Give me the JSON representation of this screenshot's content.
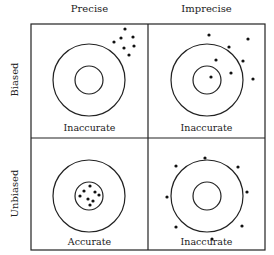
{
  "columns": [
    {
      "label": "Precise"
    },
    {
      "label": "Imprecise"
    }
  ],
  "rows": [
    {
      "label": "Biased"
    },
    {
      "label": "Unbiased"
    }
  ],
  "cells": [
    {
      "id": "biased-precise",
      "label": "Inaccurate",
      "target": {
        "cx": 89,
        "cy": 80,
        "outer_r": 36,
        "inner_r": 14
      },
      "dots": [
        [
          125,
          29
        ],
        [
          121,
          38
        ],
        [
          133,
          37
        ],
        [
          114,
          42
        ],
        [
          124,
          48
        ],
        [
          134,
          46
        ],
        [
          129,
          55
        ]
      ]
    },
    {
      "id": "biased-imprecise",
      "label": "Inaccurate",
      "target": {
        "cx": 207,
        "cy": 80,
        "outer_r": 36,
        "inner_r": 14
      },
      "dots": [
        [
          209,
          35
        ],
        [
          248,
          39
        ],
        [
          229,
          47
        ],
        [
          216,
          60
        ],
        [
          243,
          61
        ],
        [
          231,
          73
        ],
        [
          211,
          77
        ],
        [
          253,
          79
        ]
      ]
    },
    {
      "id": "unbiased-precise",
      "label": "Accurate",
      "target": {
        "cx": 89,
        "cy": 196,
        "outer_r": 36,
        "inner_r": 14
      },
      "dots": [
        [
          90,
          186
        ],
        [
          84,
          191
        ],
        [
          95,
          192
        ],
        [
          80,
          196
        ],
        [
          99,
          195
        ],
        [
          88,
          199
        ],
        [
          93,
          201
        ],
        [
          90,
          205
        ]
      ]
    },
    {
      "id": "unbiased-imprecise",
      "label": "Inaccurate",
      "target": {
        "cx": 207,
        "cy": 196,
        "outer_r": 36,
        "inner_r": 14
      },
      "dots": [
        [
          205,
          158
        ],
        [
          176,
          166
        ],
        [
          238,
          167
        ],
        [
          167,
          197
        ],
        [
          247,
          192
        ],
        [
          176,
          227
        ],
        [
          242,
          226
        ],
        [
          212,
          239
        ]
      ]
    }
  ],
  "colors": {
    "line": "#222222",
    "dot": "#111111",
    "background": "#ffffff"
  }
}
